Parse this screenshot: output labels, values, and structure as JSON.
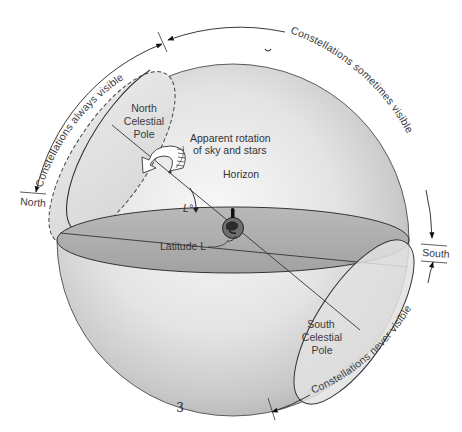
{
  "figure": {
    "page_number": "3",
    "labels": {
      "north_celestial_pole": [
        "North",
        "Celestial",
        "Pole"
      ],
      "south_celestial_pole": [
        "South",
        "Celestial",
        "Pole"
      ],
      "rotation": [
        "Apparent rotation",
        "of sky and stars"
      ],
      "horizon": "Horizon",
      "latitude_angle": "L°",
      "latitude": "Latitude L"
    },
    "arcs": {
      "always_visible": "Constellations always visible",
      "sometimes_visible": "Constellations sometimes visible",
      "never_visible": "Constellations never visible"
    },
    "directions": {
      "north": "North",
      "south": "South"
    },
    "colors": {
      "sphere_light": "#f2f2f2",
      "sphere_dark": "#b8b8b8",
      "horizon_plane": "#a9a9a9",
      "outline": "#333333",
      "text": "#333333"
    }
  }
}
